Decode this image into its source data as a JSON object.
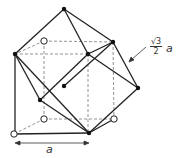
{
  "diagram": {
    "labels": {
      "edge_length": "a",
      "diagonal_label_num": "√3",
      "diagonal_label_den": "2",
      "diagonal_label_var": "a"
    },
    "filled_atoms": [
      [
        64,
        9
      ],
      [
        15,
        54
      ],
      [
        88,
        54
      ],
      [
        113,
        42
      ],
      [
        64,
        86
      ],
      [
        40,
        100
      ],
      [
        138,
        88
      ],
      [
        89,
        133
      ]
    ],
    "open_atoms": [
      [
        44,
        41
      ],
      [
        44,
        119
      ],
      [
        14,
        134
      ],
      [
        114,
        119
      ]
    ],
    "colors": {
      "line": "#222222",
      "dashed": "#666666",
      "atom": "#111111"
    }
  }
}
